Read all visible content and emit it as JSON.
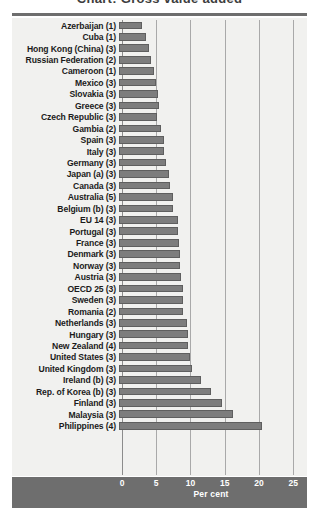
{
  "chart_data": {
    "type": "bar",
    "orientation": "horizontal",
    "title": "Chart: Gross value added",
    "xlabel": "Per cent",
    "ylabel": "",
    "xlim": [
      0,
      26
    ],
    "xticks": [
      0,
      5,
      10,
      15,
      20,
      25
    ],
    "xtick_labels": [
      "0",
      "5",
      "10",
      "15",
      "20",
      "25"
    ],
    "grid": "vertical",
    "legend": "none",
    "bar_color": "#7d7d7d",
    "background_color": "#f1f1ef",
    "footer_color": "#6e6e6e",
    "categories": [
      "Azerbaijan (1)",
      "Cuba (1)",
      "Hong Kong (China) (3)",
      "Russian Federation (2)",
      "Cameroon (1)",
      "Mexico (3)",
      "Slovakia (3)",
      "Greece (3)",
      "Czech Republic (3)",
      "Gambia (2)",
      "Spain (3)",
      "Italy (3)",
      "Germany (3)",
      "Japan (a) (3)",
      "Canada (3)",
      "Australia (5)",
      "Belgium (b) (3)",
      "EU 14 (3)",
      "Portugal (3)",
      "France (3)",
      "Denmark (3)",
      "Norway (3)",
      "Austria (3)",
      "OECD 25 (3)",
      "Sweden (3)",
      "Romania (2)",
      "Netherlands (3)",
      "Hungary (3)",
      "New Zealand (4)",
      "United States (3)",
      "United Kingdom (3)",
      "Ireland (b) (3)",
      "Rep. of Korea (b) (3)",
      "Finland (3)",
      "Malaysia (3)",
      "Philippines (4)"
    ],
    "values": [
      3.3,
      4.0,
      4.4,
      4.7,
      5.1,
      5.4,
      5.7,
      5.9,
      5.6,
      6.1,
      6.6,
      6.6,
      6.9,
      7.3,
      7.4,
      7.9,
      7.9,
      8.6,
      8.6,
      8.7,
      8.9,
      8.9,
      9.0,
      9.3,
      9.3,
      9.4,
      10.0,
      10.1,
      10.1,
      10.4,
      10.7,
      12.0,
      13.4,
      15.1,
      16.6,
      20.9
    ]
  }
}
